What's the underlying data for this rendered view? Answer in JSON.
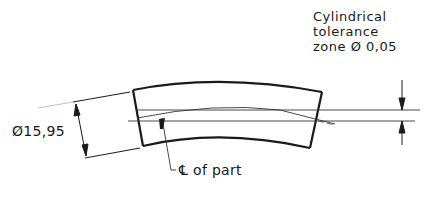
{
  "drawing": {
    "annotation": {
      "lines": [
        "Cylindrical",
        "tolerance",
        "zone Ø 0,05"
      ]
    },
    "diameter_dimension": {
      "label": "Ø15,95"
    },
    "centerline_callout": {
      "label": "℄ of part"
    }
  }
}
